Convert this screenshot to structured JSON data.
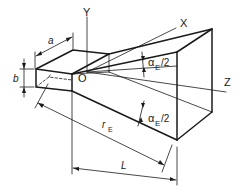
{
  "diagram": {
    "axes": {
      "x_label": "X",
      "y_label": "Y",
      "z_label": "Z",
      "origin_label": "O"
    },
    "dimensions": {
      "waveguide_width": "a",
      "waveguide_height": "b",
      "slant_length": "r",
      "slant_length_sub": "E",
      "horn_length": "L"
    },
    "angles": {
      "upper": {
        "symbol": "α",
        "sub": "E",
        "suffix": "/2"
      },
      "lower": {
        "symbol": "α",
        "sub": "E",
        "suffix": "/2"
      }
    },
    "colors": {
      "line": "#1a1a1a",
      "background": "#ffffff"
    }
  }
}
